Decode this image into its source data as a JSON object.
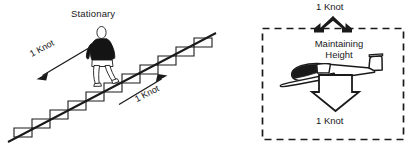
{
  "figure": {
    "background_color": "#ffffff",
    "ink_color": "#1a1a1a"
  },
  "left_panel": {
    "name": "escalator-analogy",
    "caption": "Stationary",
    "descent_arrow_label": "1 Knot",
    "ascent_arrow_label": "1 Knot",
    "figure_icon": "walking-person-icon",
    "staircase_icon": "staircase-icon",
    "descent_arrow_icon": "arrow-down-left-icon",
    "ascent_arrow_icon": "arrow-up-right-icon"
  },
  "right_panel": {
    "name": "glider-analogy",
    "border_style": "dashed",
    "top_arrow_label": "1 Knot",
    "status_text_line1": "Maintaining",
    "status_text_line2": "Height",
    "bottom_arrow_label": "1 Knot",
    "glider_icon": "glider-aircraft-icon",
    "top_arrow_icon": "chevron-up-double-arrow-icon",
    "bottom_arrow_icon": "arrow-down-icon"
  }
}
